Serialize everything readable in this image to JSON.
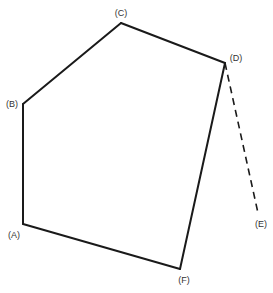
{
  "diagram": {
    "type": "polygon-with-extension",
    "vertices": [
      {
        "id": "A",
        "label": "(A)",
        "x": 23,
        "y": 224,
        "lx": 14,
        "ly": 238
      },
      {
        "id": "B",
        "label": "(B)",
        "x": 23,
        "y": 104,
        "lx": 12,
        "ly": 107
      },
      {
        "id": "C",
        "label": "(C)",
        "x": 121,
        "y": 23,
        "lx": 121,
        "ly": 16
      },
      {
        "id": "D",
        "label": "(D)",
        "x": 225,
        "y": 63,
        "lx": 236,
        "ly": 61
      },
      {
        "id": "E",
        "label": "(E)",
        "x": 258,
        "y": 213,
        "lx": 261,
        "ly": 227
      },
      {
        "id": "F",
        "label": "(F)",
        "x": 180,
        "y": 269,
        "lx": 184,
        "ly": 283
      }
    ],
    "solid_edges": [
      [
        "A",
        "B"
      ],
      [
        "B",
        "C"
      ],
      [
        "C",
        "D"
      ],
      [
        "D",
        "F"
      ],
      [
        "F",
        "A"
      ]
    ],
    "dashed_edges": [
      [
        "D",
        "E"
      ]
    ],
    "labels": {
      "A": "(A)",
      "B": "(B)",
      "C": "(C)",
      "D": "(D)",
      "E": "(E)",
      "F": "(F)"
    },
    "colors": {
      "stroke": "#1a1a1a",
      "label": "#333333",
      "background": "#ffffff"
    }
  }
}
